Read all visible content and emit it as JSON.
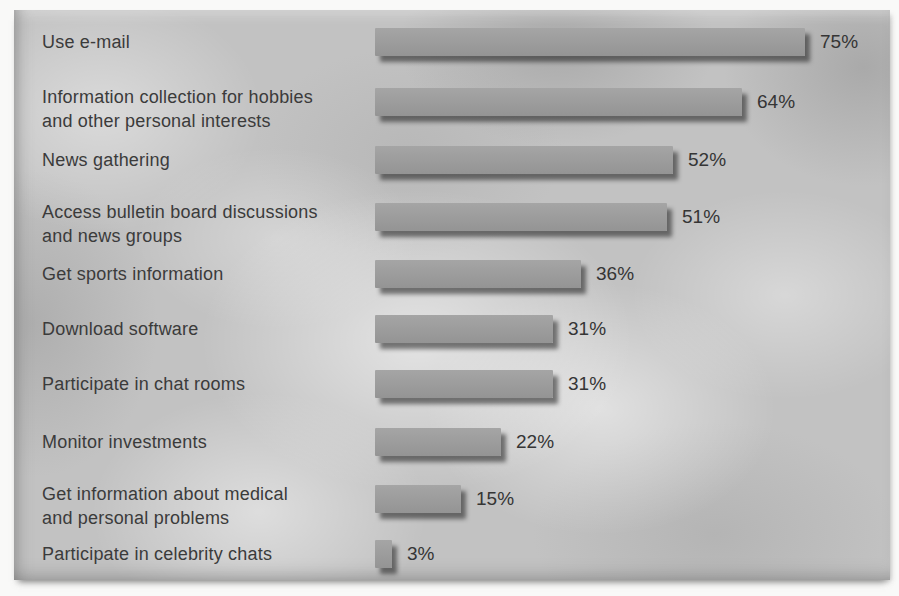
{
  "figure": {
    "panel_background_color": "#c2c2c2",
    "bar_color": "#9c9c9c",
    "bar_color_top": "#a5a5a5",
    "bar_color_bottom": "#949494",
    "shadow_color": "#191919",
    "text_color": "#3b3b3b"
  },
  "chart_data": {
    "type": "bar",
    "orientation": "horizontal",
    "title": "",
    "xlabel": "",
    "ylabel": "",
    "unit": "%",
    "xlim": [
      0,
      100
    ],
    "grid": false,
    "legend": false,
    "categories": [
      "Use e-mail",
      "Information collection for hobbies\nand other personal interests",
      "News gathering",
      "Access bulletin board discussions\nand news groups",
      "Get sports information",
      "Download software",
      "Participate in chat rooms",
      "Monitor investments",
      "Get information about medical\nand personal problems",
      "Participate in celebrity chats"
    ],
    "values": [
      75,
      64,
      52,
      51,
      36,
      31,
      31,
      22,
      15,
      3
    ],
    "value_labels": [
      "75%",
      "64%",
      "52%",
      "51%",
      "36%",
      "31%",
      "31%",
      "22%",
      "15%",
      "3%"
    ]
  }
}
